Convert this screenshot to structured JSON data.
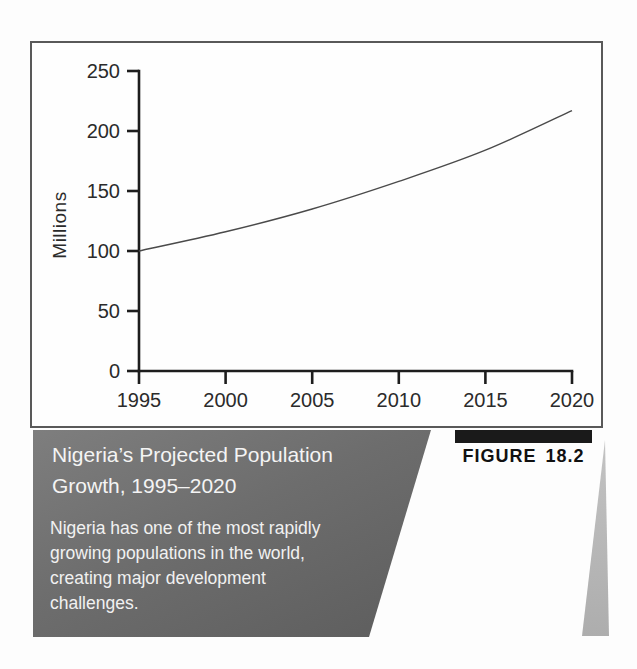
{
  "chart_data": {
    "type": "line",
    "x": [
      1995,
      2000,
      2005,
      2010,
      2015,
      2020
    ],
    "values": [
      100,
      116,
      135,
      158,
      184,
      217
    ],
    "series_name": "Projected population of Nigeria",
    "title": "",
    "xlabel": "",
    "ylabel": "Millions",
    "x_ticks": [
      1995,
      2000,
      2005,
      2010,
      2015,
      2020
    ],
    "y_ticks": [
      0,
      50,
      100,
      150,
      200,
      250
    ],
    "xlim": [
      1995,
      2020
    ],
    "ylim": [
      0,
      250
    ],
    "grid": false,
    "legend": false,
    "line_color": "#4a4a4a",
    "axis_color": "#1d1d1d",
    "tick_label_color": "#2b2b2b"
  },
  "caption": {
    "title": "Nigeria’s Projected Population Growth, 1995–2020",
    "subtitle": "Nigeria has one of the most rapidly growing populations in the world, creating major development challenges.",
    "figure_label": "FIGURE 18.2"
  },
  "colors": {
    "caption_band": "#6d6d6d",
    "caption_text": "#f4f4f4",
    "figure_bar": "#1a1a1a",
    "figure_text": "#111111",
    "frame_border": "#595959",
    "wedge": "#b5b5b5"
  }
}
